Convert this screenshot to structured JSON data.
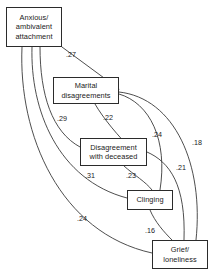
{
  "diagram": {
    "type": "path-diagram",
    "title": "",
    "nodes": [
      {
        "id": "anxious",
        "label": "Anxious/\nambivalent\nattachment",
        "x": 6,
        "y": 7,
        "w": 56,
        "h": 40
      },
      {
        "id": "marital",
        "label": "Marital\ndisagreements",
        "x": 53,
        "y": 77,
        "w": 66,
        "h": 27
      },
      {
        "id": "disagreement",
        "label": "Disagreement\nwith deceased",
        "x": 80,
        "y": 138,
        "w": 67,
        "h": 28
      },
      {
        "id": "clinging",
        "label": "Clinging",
        "x": 127,
        "y": 190,
        "w": 46,
        "h": 20
      },
      {
        "id": "grief",
        "label": "Grief/\nloneliness",
        "x": 152,
        "y": 240,
        "w": 56,
        "h": 29
      }
    ],
    "edges": [
      {
        "id": "e1",
        "from": "anxious",
        "to": "marital",
        "coefficient": ".27",
        "label_x": 71,
        "label_y": 55
      },
      {
        "id": "e2",
        "from": "anxious",
        "to": "disagreement",
        "coefficient": ".29",
        "label_x": 62,
        "label_y": 119
      },
      {
        "id": "e3",
        "from": "marital",
        "to": "disagreement",
        "coefficient": ".22",
        "label_x": 108,
        "label_y": 118
      },
      {
        "id": "e4",
        "from": "marital",
        "to": "clinging",
        "coefficient": ".24",
        "label_x": 157,
        "label_y": 135
      },
      {
        "id": "e5",
        "from": "marital",
        "to": "grief",
        "coefficient": ".18",
        "label_x": 197,
        "label_y": 143
      },
      {
        "id": "e6",
        "from": "anxious",
        "to": "clinging",
        "coefficient": ".31",
        "label_x": 90,
        "label_y": 176
      },
      {
        "id": "e7",
        "from": "disagreement",
        "to": "clinging",
        "coefficient": ".23",
        "label_x": 131,
        "label_y": 176
      },
      {
        "id": "e8",
        "from": "disagreement",
        "to": "grief",
        "coefficient": ".21",
        "label_x": 181,
        "label_y": 168
      },
      {
        "id": "e9",
        "from": "anxious",
        "to": "grief",
        "coefficient": ".24",
        "label_x": 82,
        "label_y": 219
      },
      {
        "id": "e10",
        "from": "clinging",
        "to": "grief",
        "coefficient": ".16",
        "label_x": 150,
        "label_y": 231
      }
    ],
    "style": {
      "stroke": "#3a3a3a",
      "box_border": "#2b2b2b",
      "background": "#ffffff",
      "text_color": "#1a1a1a"
    },
    "paths": [
      {
        "id": "e1",
        "d": "M 62 47 L 119 89"
      },
      {
        "id": "e2",
        "d": "M 40 47 C 40 95, 52 132, 80 147"
      },
      {
        "id": "e3",
        "d": "M 95 104 C 103 118, 118 136, 133 151"
      },
      {
        "id": "e4",
        "d": "M 119 94 C 150 103, 168 140, 160 190"
      },
      {
        "id": "e5",
        "d": "M 119 92 C 175 98, 204 165, 196 240"
      },
      {
        "id": "e6",
        "d": "M 32 47 C 30 110, 58 180, 127 198"
      },
      {
        "id": "e7",
        "d": "M 124 166 C 134 175, 146 182, 152 190"
      },
      {
        "id": "e8",
        "d": "M 147 152 C 170 162, 186 185, 184 240"
      },
      {
        "id": "e9",
        "d": "M 22 47 C 18 135, 60 233, 152 253"
      },
      {
        "id": "e10",
        "d": "M 150 210 C 155 222, 164 232, 172 240"
      }
    ]
  }
}
